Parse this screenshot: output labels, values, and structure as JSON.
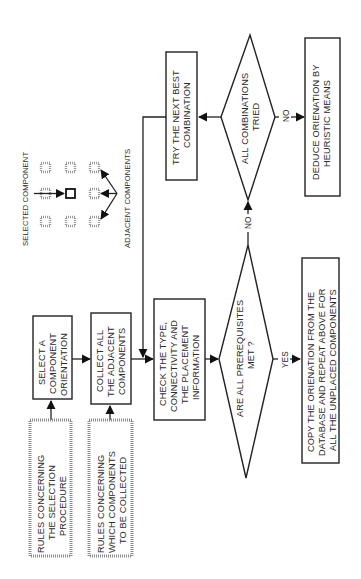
{
  "diagram": {
    "orientation": "rotated 90° counter-clockwise",
    "inset": {
      "selected_label": "SELECTED COMPONENT",
      "adjacent_label": "ADJACENT COMPONENTS"
    },
    "nodes": {
      "rules_selection": {
        "lines": [
          "RULES CONCERNING",
          "THE SELECTION",
          "PROCEDURE"
        ]
      },
      "rules_collection": {
        "lines": [
          "RULES CONCERNING",
          "WHICH COMPONENTS",
          "TO BE COLLECTED"
        ]
      },
      "select_orientation": {
        "lines": [
          "SELECT A",
          "COMPONENT",
          "ORIENTATION"
        ]
      },
      "collect_adjacent": {
        "lines": [
          "COLLECT ALL",
          "THE ADJACENT",
          "COMPONENTS"
        ]
      },
      "check_info": {
        "lines": [
          "CHECK THE TYPE,",
          "CONNECTIVITY AND",
          "THE PLACEMENT",
          "INFORMATION"
        ]
      },
      "prereq_decision": {
        "lines": [
          "ARE ALL PREREQUISITES",
          "MET ?"
        ]
      },
      "copy_orientation": {
        "lines": [
          "COPY THE ORIENATION FROM THE",
          "DATABASE AND REPEAT ABOVE FOR",
          "ALL THE UNPLACED COMPONENTS"
        ]
      },
      "combinations_decision": {
        "lines": [
          "ALL COMBINATIONS",
          "TRIED"
        ]
      },
      "try_next": {
        "lines": [
          "TRY THE NEXT BEST",
          "COMBINATION"
        ]
      },
      "deduce_heuristic": {
        "lines": [
          "DEDUCE ORIENATION BY",
          "HEURISTIC MEANS"
        ]
      }
    },
    "edge_labels": {
      "prereq_yes": "YES",
      "prereq_no": "NO",
      "combinations_no": "NO"
    }
  }
}
